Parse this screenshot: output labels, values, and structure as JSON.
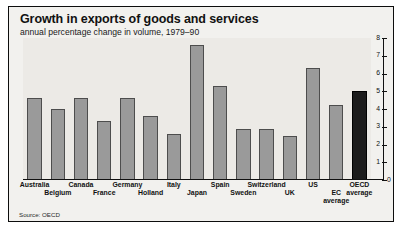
{
  "chart_data": {
    "type": "bar",
    "title": "Growth in exports of goods and services",
    "subtitle": "annual percentage change in volume, 1979–90",
    "source": "Source: OECD",
    "xlabel": "",
    "ylabel": "",
    "ylim": [
      0,
      8
    ],
    "yticks": [
      "0",
      "1",
      "2",
      "3",
      "4",
      "5",
      "6",
      "7",
      "8"
    ],
    "axis_position": "right",
    "grid": false,
    "legend": "none",
    "categories": [
      "Australia",
      "Belgium",
      "Canada",
      "France",
      "Germany",
      "Holland",
      "Italy",
      "Japan",
      "Spain",
      "Sweden",
      "Switzerland",
      "UK",
      "US",
      "EC average",
      "OECD average"
    ],
    "values": [
      4.6,
      4.0,
      4.6,
      3.3,
      4.6,
      3.6,
      2.6,
      7.6,
      5.3,
      2.9,
      2.9,
      2.5,
      6.3,
      4.2,
      5.0
    ],
    "highlight_index": 14,
    "colors": {
      "bar": "#9a9a9a",
      "bar_border": "#4d4d4d",
      "highlight_bar": "#1c1c1c",
      "plot_background": "#eceae6",
      "figure_background": "#f2f1ee",
      "frame": "#0d0d0d",
      "text": "#111111"
    }
  }
}
